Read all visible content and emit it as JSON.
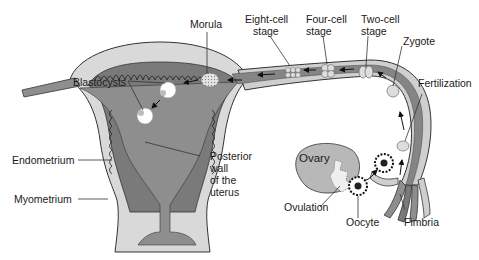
{
  "colors": {
    "myometrium": "#d9d9d9",
    "endometrium": "#7a7a7a",
    "cavity": "#8e8e8e",
    "tube_wall": "#cfcfcf",
    "tube_lumen": "#858585",
    "ovary": "#b8b8b8",
    "outline": "#333333",
    "label_text": "#1a1a1a"
  },
  "labels": {
    "morula": "Morula",
    "eight_cell_line1": "Eight-cell",
    "eight_cell_line2": "stage",
    "four_cell_line1": "Four-cell",
    "four_cell_line2": "stage",
    "two_cell_line1": "Two-cell",
    "two_cell_line2": "stage",
    "zygote": "Zygote",
    "fertilization": "Fertilization",
    "blastocysts": "Blastocysts",
    "endometrium": "Endometrium",
    "myometrium": "Myometrium",
    "posterior_line1": "Posterior",
    "posterior_line2": "wall",
    "posterior_line3": "of the",
    "posterior_line4": "uterus",
    "ovary": "Ovary",
    "ovulation": "Ovulation",
    "oocyte": "Oocyte",
    "fimbria": "Fimbria"
  }
}
